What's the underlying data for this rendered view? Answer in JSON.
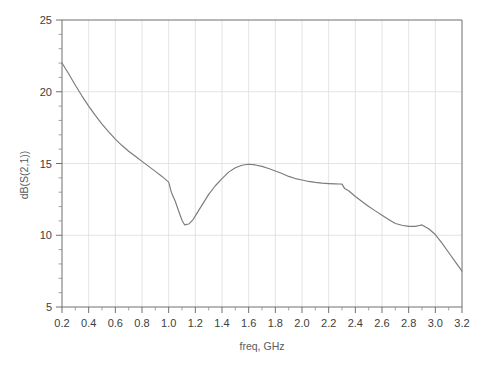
{
  "chart_data": {
    "type": "line",
    "title": "",
    "xlabel": "freq, GHz",
    "ylabel": "dB(S(2,1))",
    "xlim": [
      0.2,
      3.2
    ],
    "ylim": [
      5,
      25
    ],
    "grid": true,
    "legend": "none",
    "x_major_step": 0.2,
    "x_minor_per_major": 2,
    "y_major_step": 5,
    "y_minor_per_major": 5,
    "x_ticklabels": [
      "0.2",
      "0.4",
      "0.6",
      "0.8",
      "1.0",
      "1.2",
      "1.4",
      "1.6",
      "1.8",
      "2.0",
      "2.2",
      "2.4",
      "2.6",
      "2.8",
      "3.0",
      "3.2"
    ],
    "y_ticklabels": [
      "5",
      "10",
      "15",
      "20",
      "25"
    ],
    "series": [
      {
        "name": "dB(S(2,1))",
        "color": "#7b7b7b",
        "x": [
          0.2,
          0.25,
          0.3,
          0.35,
          0.4,
          0.45,
          0.5,
          0.55,
          0.6,
          0.65,
          0.7,
          0.75,
          0.8,
          0.85,
          0.9,
          0.95,
          1.0,
          1.02,
          1.05,
          1.08,
          1.1,
          1.12,
          1.15,
          1.18,
          1.2,
          1.25,
          1.3,
          1.35,
          1.4,
          1.45,
          1.5,
          1.55,
          1.6,
          1.65,
          1.7,
          1.75,
          1.8,
          1.85,
          1.9,
          1.95,
          2.0,
          2.05,
          2.1,
          2.15,
          2.2,
          2.25,
          2.28,
          2.3,
          2.32,
          2.35,
          2.4,
          2.45,
          2.5,
          2.55,
          2.6,
          2.65,
          2.7,
          2.75,
          2.8,
          2.85,
          2.88,
          2.9,
          2.95,
          3.0,
          3.05,
          3.1,
          3.15,
          3.2
        ],
        "y": [
          22.0,
          21.25,
          20.45,
          19.7,
          19.0,
          18.35,
          17.75,
          17.2,
          16.7,
          16.25,
          15.85,
          15.5,
          15.15,
          14.8,
          14.45,
          14.1,
          13.7,
          13.0,
          12.35,
          11.55,
          11.05,
          10.72,
          10.78,
          11.05,
          11.35,
          12.1,
          12.85,
          13.45,
          13.95,
          14.4,
          14.7,
          14.88,
          14.95,
          14.9,
          14.8,
          14.65,
          14.48,
          14.3,
          14.1,
          13.95,
          13.85,
          13.75,
          13.68,
          13.63,
          13.6,
          13.58,
          13.57,
          13.56,
          13.25,
          13.1,
          12.7,
          12.35,
          12.0,
          11.7,
          11.4,
          11.1,
          10.82,
          10.7,
          10.62,
          10.62,
          10.68,
          10.72,
          10.45,
          10.05,
          9.45,
          8.8,
          8.15,
          7.5
        ]
      }
    ]
  },
  "axes": {
    "x_axis_title": "freq, GHz",
    "y_axis_title": "dB(S(2,1))"
  }
}
